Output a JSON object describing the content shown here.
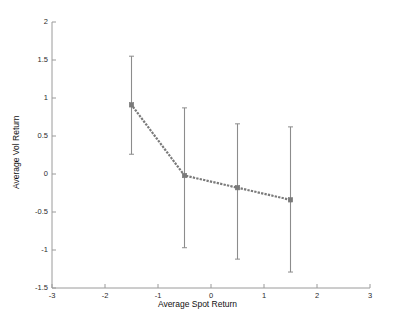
{
  "chart_data": {
    "type": "scatter",
    "title": "",
    "xlabel": "Average Spot Return",
    "ylabel": "Average Vol Return",
    "xlim": [
      -3,
      3
    ],
    "ylim": [
      -1.5,
      2
    ],
    "xticks": [
      "-3",
      "-2",
      "-1",
      "0",
      "1",
      "2",
      "3"
    ],
    "xtick_values": [
      -3,
      -2,
      -1,
      0,
      1,
      2,
      3
    ],
    "yticks": [
      "2",
      "1.5",
      "1",
      "0.5",
      "0",
      "-0.5",
      "-1",
      "-1.5"
    ],
    "ytick_values": [
      2,
      1.5,
      1,
      0.5,
      0,
      -0.5,
      -1,
      -1.5
    ],
    "grid": false,
    "legend": null,
    "series_name": "Average Vol Return vs Average Spot Return",
    "line_style": "dotted",
    "marker": "square",
    "series_color": "#7a7a7a",
    "errorbar_color": "#8c8c8c",
    "axis_color": "#9a9a9a",
    "x": [
      -1.5,
      -0.5,
      0.5,
      1.5
    ],
    "y": [
      0.91,
      -0.02,
      -0.18,
      -0.34
    ],
    "yerr_upper": [
      1.55,
      0.87,
      0.66,
      0.62
    ],
    "yerr_lower": [
      0.26,
      -0.97,
      -1.12,
      -1.29
    ],
    "points": [
      {
        "x": -1.5,
        "y": 0.91,
        "upper": 1.55,
        "lower": 0.26
      },
      {
        "x": -0.5,
        "y": -0.02,
        "upper": 0.87,
        "lower": -0.97
      },
      {
        "x": 0.5,
        "y": -0.18,
        "upper": 0.66,
        "lower": -1.12
      },
      {
        "x": 1.5,
        "y": -0.34,
        "upper": 0.62,
        "lower": -1.29
      }
    ]
  }
}
